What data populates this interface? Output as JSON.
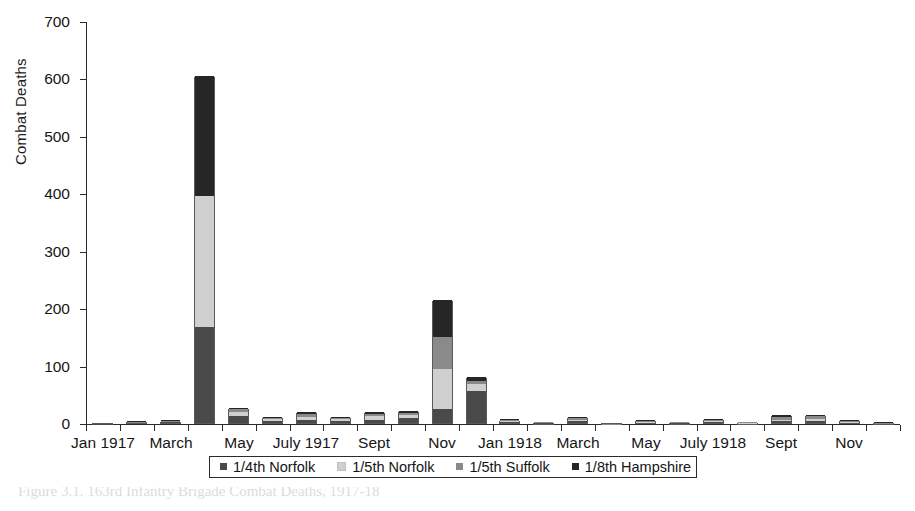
{
  "chart_data": {
    "type": "bar",
    "stacked": true,
    "title": "",
    "xlabel": "",
    "ylabel": "Combat Deaths",
    "ylim": [
      0,
      700
    ],
    "yticks": [
      0,
      100,
      200,
      300,
      400,
      500,
      600,
      700
    ],
    "grid": false,
    "legend_position": "bottom",
    "series": [
      {
        "name": "1/4th Norfolk",
        "color": "#4a4a4a",
        "values": [
          1,
          0,
          2,
          167,
          12,
          4,
          6,
          3,
          5,
          8,
          24,
          55,
          2,
          1,
          4,
          0,
          1,
          1,
          1,
          0,
          4,
          4,
          1,
          0
        ]
      },
      {
        "name": "1/5th Norfolk",
        "color": "#d0d0d0",
        "values": [
          0,
          1,
          0,
          228,
          8,
          3,
          5,
          4,
          7,
          6,
          70,
          13,
          1,
          0,
          2,
          0,
          1,
          0,
          3,
          1,
          2,
          3,
          1,
          0
        ]
      },
      {
        "name": "1/5th Suffolk",
        "color": "#8a8a8a",
        "values": [
          0,
          1,
          1,
          0,
          4,
          2,
          4,
          2,
          3,
          3,
          55,
          5,
          2,
          1,
          3,
          1,
          2,
          1,
          2,
          1,
          5,
          5,
          2,
          1
        ]
      },
      {
        "name": "1/8th Hampshire",
        "color": "#262626",
        "values": [
          0,
          1,
          1,
          210,
          2,
          2,
          4,
          2,
          4,
          4,
          66,
          7,
          1,
          0,
          2,
          0,
          1,
          0,
          1,
          0,
          3,
          2,
          1,
          1
        ]
      }
    ],
    "categories": [
      "Jan 1917",
      "Feb 1917",
      "March 1917",
      "April 1917",
      "May 1917",
      "June 1917",
      "July 1917",
      "Aug 1917",
      "Sept 1917",
      "Oct 1917",
      "Nov 1917",
      "Dec 1917",
      "Jan 1918",
      "Feb 1918",
      "March 1918",
      "April 1918",
      "May 1918",
      "June 1918",
      "July 1918",
      "Aug 1918",
      "Sept 1918",
      "Oct 1918",
      "Nov 1918",
      "Dec 1918"
    ],
    "totals": [
      1,
      3,
      4,
      605,
      26,
      11,
      19,
      11,
      19,
      21,
      215,
      80,
      6,
      2,
      11,
      1,
      5,
      2,
      7,
      2,
      14,
      14,
      5,
      2
    ],
    "xtick_labels": [
      {
        "index": 0,
        "label": "Jan 1917"
      },
      {
        "index": 2,
        "label": "March"
      },
      {
        "index": 4,
        "label": "May"
      },
      {
        "index": 6,
        "label": "July 1917"
      },
      {
        "index": 8,
        "label": "Sept"
      },
      {
        "index": 10,
        "label": "Nov"
      },
      {
        "index": 12,
        "label": "Jan 1918"
      },
      {
        "index": 14,
        "label": "March"
      },
      {
        "index": 16,
        "label": "May"
      },
      {
        "index": 18,
        "label": "July 1918"
      },
      {
        "index": 20,
        "label": "Sept"
      },
      {
        "index": 22,
        "label": "Nov"
      }
    ]
  },
  "axes": {
    "y_axis_label": "Combat Deaths",
    "y_tick_labels": [
      "0",
      "100",
      "200",
      "300",
      "400",
      "500",
      "600",
      "700"
    ]
  },
  "legend": {
    "items": [
      {
        "label": "1/4th Norfolk",
        "color": "#4a4a4a"
      },
      {
        "label": "1/5th Norfolk",
        "color": "#d0d0d0"
      },
      {
        "label": "1/5th Suffolk",
        "color": "#8a8a8a"
      },
      {
        "label": "1/8th Hampshire",
        "color": "#262626"
      }
    ]
  },
  "caption": {
    "text": "Figure 3.1. 163rd Infantry Brigade Combat Deaths, 1917-18"
  }
}
